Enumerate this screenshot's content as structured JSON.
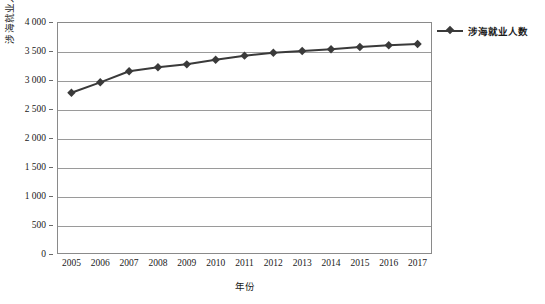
{
  "chart_data": {
    "type": "line",
    "title": "",
    "xlabel": "年份",
    "ylabel": "涉海就业人员数 (万人)",
    "grid": true,
    "legend_position": "right",
    "xlim": [
      2005,
      2017
    ],
    "ylim": [
      0,
      4000
    ],
    "ytick_labels": [
      "4 000",
      "3 500",
      "3 000",
      "2 500",
      "2 000",
      "1 500",
      "1 000",
      "500",
      "0"
    ],
    "ytick_values": [
      4000,
      3500,
      3000,
      2500,
      2000,
      1500,
      1000,
      500,
      0
    ],
    "categories": [
      2005,
      2006,
      2007,
      2008,
      2009,
      2010,
      2011,
      2012,
      2013,
      2014,
      2015,
      2016,
      2017
    ],
    "xtick_labels": [
      "2005",
      "2006",
      "2007",
      "2008",
      "2009",
      "2010",
      "2011",
      "2012",
      "2013",
      "2014",
      "2015",
      "2016",
      "2017"
    ],
    "series": [
      {
        "name": "涉海就业人数",
        "color": "#3a3a3a",
        "marker": "diamond",
        "values": [
          2780,
          2960,
          3150,
          3220,
          3270,
          3350,
          3420,
          3470,
          3500,
          3530,
          3570,
          3600,
          3620
        ]
      }
    ]
  },
  "legend": {
    "items": [
      {
        "label": "涉海就业人数"
      }
    ]
  }
}
